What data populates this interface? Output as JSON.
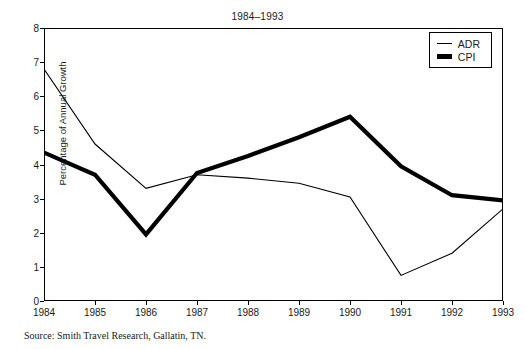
{
  "top_caption": "",
  "title": "1984–1993",
  "source": "Source: Smith Travel Research, Gallatin, TN.",
  "legend": {
    "position": "top-right",
    "items": [
      {
        "label": "ADR",
        "style": "thin"
      },
      {
        "label": "CPI",
        "style": "thick"
      }
    ]
  },
  "chart_data": {
    "type": "line",
    "title": "1984–1993",
    "xlabel": "",
    "ylabel": "Percentage of Annual Growth",
    "x": [
      1984,
      1985,
      1986,
      1987,
      1988,
      1989,
      1990,
      1991,
      1992,
      1993
    ],
    "xtick_labels": [
      "1984",
      "1985",
      "1986",
      "1987",
      "1988",
      "1989",
      "1990",
      "1991",
      "1992",
      "1993"
    ],
    "ytick_labels": [
      "0",
      "1",
      "2",
      "3",
      "4",
      "5",
      "6",
      "7",
      "8"
    ],
    "yticks": [
      0,
      1,
      2,
      3,
      4,
      5,
      6,
      7,
      8
    ],
    "ylim": [
      0,
      8
    ],
    "xlim": [
      1984,
      1993
    ],
    "grid": false,
    "series": [
      {
        "name": "ADR",
        "style": "thin",
        "color": "#000000",
        "values": [
          6.8,
          4.6,
          3.3,
          3.7,
          3.6,
          3.45,
          3.05,
          0.75,
          1.4,
          2.7
        ]
      },
      {
        "name": "CPI",
        "style": "thick",
        "color": "#000000",
        "values": [
          4.35,
          3.7,
          1.95,
          3.75,
          4.25,
          4.8,
          5.4,
          3.95,
          3.1,
          2.95
        ]
      }
    ]
  }
}
